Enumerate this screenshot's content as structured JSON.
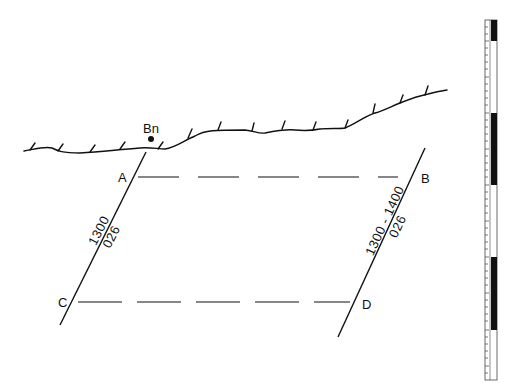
{
  "diagram": {
    "surface": {
      "label": "Bn"
    },
    "points": {
      "A": "A",
      "B": "B",
      "C": "C",
      "D": "D"
    },
    "fault_left": {
      "line1": "1300",
      "line2": "026"
    },
    "fault_right": {
      "line1": "1300 - 1400",
      "line2": "026"
    },
    "scale_bar": {
      "segments": [
        "black",
        "white",
        "black",
        "white",
        "black",
        "white"
      ]
    },
    "colors": {
      "ink": "#111111",
      "background": "#ffffff"
    }
  }
}
